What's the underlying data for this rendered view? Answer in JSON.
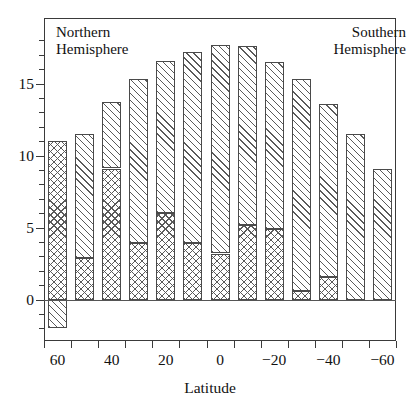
{
  "chart_data": {
    "type": "bar",
    "title": "",
    "subtitle": "",
    "xlabel": "Latitude",
    "ylabel": "",
    "stacked": true,
    "grid": false,
    "legend_position": "none",
    "xlim": [
      70,
      -70
    ],
    "ylim": [
      -3,
      18.5
    ],
    "y_major_ticks": [
      0,
      5,
      10,
      15
    ],
    "y_major_tick_labels": [
      "0",
      "5",
      "10",
      "15"
    ],
    "y_minor_tick_interval": 1,
    "x_tick_labels": [
      "60",
      "40",
      "20",
      "0",
      "−20",
      "−40",
      "−60"
    ],
    "x_tick_values": [
      60,
      40,
      20,
      0,
      -20,
      -40,
      -60
    ],
    "categories": [
      60,
      50,
      40,
      30,
      20,
      10,
      0,
      -10,
      -20,
      -30,
      -40,
      -50,
      -60
    ],
    "category_labels": [
      "60",
      "50",
      "40",
      "30",
      "20",
      "10",
      "0",
      "-10",
      "-20",
      "-30",
      "-40",
      "-50",
      "-60"
    ],
    "series": [
      {
        "name": "lower-segment",
        "pattern": "cross-hatch",
        "values": [
          11.0,
          2.9,
          9.1,
          3.9,
          6.0,
          3.9,
          3.2,
          5.2,
          4.9,
          0.6,
          1.6,
          0.0,
          0.0
        ]
      },
      {
        "name": "upper-segment",
        "pattern": "diagonal-hatch",
        "values": [
          0.0,
          8.6,
          4.6,
          11.4,
          10.6,
          13.3,
          14.5,
          12.4,
          11.6,
          14.7,
          12.0,
          11.5,
          9.1
        ]
      }
    ],
    "totals": [
      11.0,
      11.5,
      13.7,
      15.3,
      16.6,
      17.2,
      17.7,
      17.6,
      16.5,
      15.3,
      13.6,
      11.5,
      9.1
    ],
    "negative_segment": {
      "name": "below-zero-segment",
      "pattern": "diagonal-hatch",
      "category": 60,
      "value": -2.0
    },
    "annotations": [
      {
        "id": "northern",
        "text": "Northern\nHemisphere",
        "position": "top-left"
      },
      {
        "id": "southern",
        "text": "Southern\nHemisphere",
        "position": "top-right"
      }
    ]
  },
  "annotations": {
    "north_line1": "Northern",
    "north_line2": "Hemisphere",
    "south_line1": "Southern",
    "south_line2": "Hemisphere"
  },
  "axes": {
    "x_title": "Latitude",
    "y_labels": [
      "15",
      "10",
      "5",
      "0"
    ],
    "x_labels": [
      "60",
      "40",
      "20",
      "0",
      "−20",
      "−40",
      "−60"
    ]
  },
  "colors": {
    "hatch": "#5a5a5a",
    "frame": "#3a3a3a",
    "text": "#111111",
    "background": "#ffffff"
  }
}
